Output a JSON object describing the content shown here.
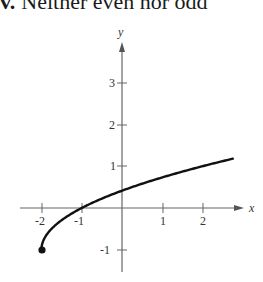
{
  "header": {
    "label": "v.",
    "text": "Neither even nor odd"
  },
  "chart_data": {
    "type": "line",
    "title": "Neither even nor odd",
    "function": "f(x) = sqrt(x + 2) - 1",
    "xlabel": "x",
    "ylabel": "y",
    "x_ticks": [
      "-2",
      "-1",
      "1",
      "2"
    ],
    "y_ticks": [
      "3",
      "2",
      "1",
      "-1"
    ],
    "xlim": [
      -2,
      3
    ],
    "ylim": [
      -1,
      4
    ],
    "grid": false,
    "series": [
      {
        "name": "f(x)",
        "x": [
          -2,
          -1.75,
          -1.5,
          -1,
          -0.5,
          0,
          0.5,
          1,
          1.5,
          2,
          2.75
        ],
        "y": [
          -1,
          -0.5,
          -0.29,
          0,
          0.22,
          0.41,
          0.58,
          0.73,
          0.87,
          1,
          1.18
        ]
      }
    ],
    "annotations": [
      "closed endpoint at (-2, -1)"
    ],
    "colors": {
      "curve": "#111111",
      "axes": "#555555"
    }
  }
}
